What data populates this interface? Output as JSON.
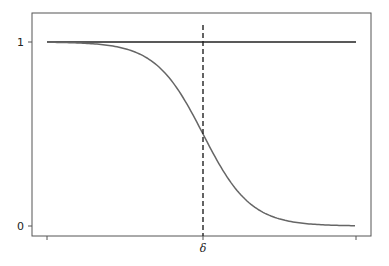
{
  "chart_data": {
    "type": "line",
    "title": "",
    "xlabel": "",
    "ylabel": "",
    "x_tick_labels": [
      "δ"
    ],
    "y_tick_labels": [
      "0",
      "1"
    ],
    "ylim": [
      0,
      1
    ],
    "grid": false,
    "legend": null,
    "series": [
      {
        "name": "constant",
        "description": "horizontal line at y = 1",
        "color": "#222222",
        "style": "solid",
        "x": [
          0,
          1
        ],
        "y": [
          1,
          1
        ]
      },
      {
        "name": "sigmoid",
        "description": "decreasing logistic curve, 1 on the left to 0 on the right, crossing 0.5 at δ",
        "color": "#666666",
        "style": "solid",
        "x": [
          0.0,
          0.1,
          0.2,
          0.3,
          0.4,
          0.5,
          0.6,
          0.7,
          0.8,
          0.9,
          1.0
        ],
        "y": [
          1.0,
          0.998,
          0.99,
          0.95,
          0.8,
          0.5,
          0.2,
          0.05,
          0.01,
          0.002,
          0.0
        ]
      }
    ],
    "annotations": [
      {
        "type": "vline",
        "label": "δ",
        "x": 0.5,
        "style": "dashed",
        "color": "#222222"
      }
    ]
  },
  "axes": {
    "y_tick_1": "1",
    "y_tick_0": "0",
    "x_tick_delta": "δ"
  }
}
